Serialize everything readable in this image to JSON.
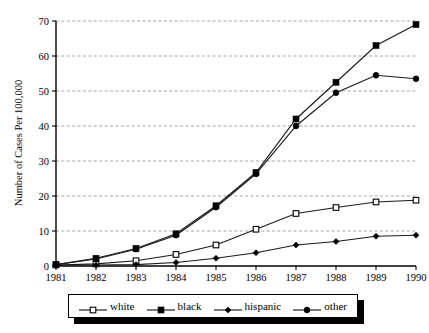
{
  "chart_data": {
    "type": "line",
    "title": "",
    "xlabel": "",
    "ylabel": "Number of Cases Per 100,000",
    "categories": [
      "1981",
      "1982",
      "1983",
      "1984",
      "1985",
      "1986",
      "1987",
      "1988",
      "1989",
      "1990"
    ],
    "x": [
      1981,
      1982,
      1983,
      1984,
      1985,
      1986,
      1987,
      1988,
      1989,
      1990
    ],
    "xlim": [
      1981,
      1990
    ],
    "ylim": [
      0,
      70
    ],
    "yticks": [
      0,
      10,
      20,
      30,
      40,
      50,
      60,
      70
    ],
    "ytick_labels": [
      "0",
      "10",
      "20",
      "30",
      "40",
      "50",
      "60",
      "70"
    ],
    "grid": "horizontal-dashed",
    "legend_position": "below-center",
    "series": [
      {
        "name": "white",
        "marker": "open-square",
        "values": [
          0.3,
          0.6,
          1.5,
          3.3,
          6.0,
          10.5,
          15.0,
          16.7,
          18.3,
          18.8
        ]
      },
      {
        "name": "black",
        "marker": "filled-square",
        "values": [
          0.4,
          2.2,
          5.0,
          9.2,
          17.2,
          26.7,
          42.0,
          52.5,
          63.0,
          69.0
        ]
      },
      {
        "name": "hispanic",
        "marker": "filled-diamond",
        "values": [
          0.2,
          0.3,
          0.4,
          1.0,
          2.2,
          3.8,
          6.0,
          7.0,
          8.5,
          8.8
        ]
      },
      {
        "name": "other",
        "marker": "filled-circle",
        "values": [
          0.4,
          2.0,
          4.8,
          8.8,
          16.8,
          26.3,
          40.0,
          49.5,
          54.5,
          53.5
        ]
      }
    ]
  },
  "legend": {
    "items": [
      {
        "label": "white",
        "marker": "open-square"
      },
      {
        "label": "black",
        "marker": "filled-square"
      },
      {
        "label": "hispanic",
        "marker": "filled-diamond"
      },
      {
        "label": "other",
        "marker": "filled-circle"
      }
    ]
  },
  "axis": {
    "y_title": "Number of Cases Per 100,000"
  }
}
